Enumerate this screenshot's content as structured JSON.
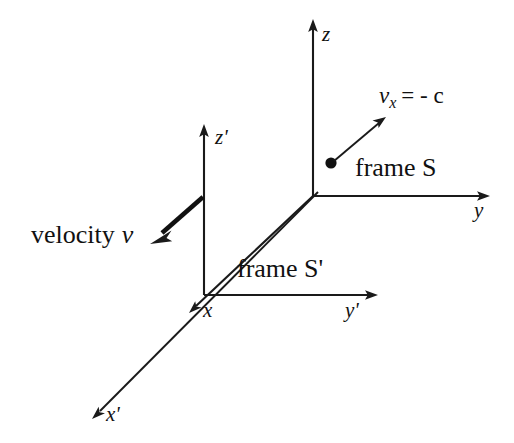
{
  "figure": {
    "type": "physics-reference-frame-diagram",
    "background_color": "#ffffff",
    "line_color": "#1a1a1a",
    "width": 514,
    "height": 443
  },
  "frame_s": {
    "name": "frame S",
    "origin": {
      "x": 313,
      "y": 196
    },
    "axes": [
      {
        "name": "z",
        "label": "z",
        "label_x": 322,
        "label_y": 26,
        "tip_x": 313,
        "tip_y": 22,
        "direction": "up"
      },
      {
        "name": "y",
        "label": "y",
        "label_x": 474,
        "label_y": 200,
        "tip_x": 490,
        "tip_y": 196,
        "direction": "right"
      },
      {
        "name": "x",
        "label": "x",
        "label_x": 201,
        "label_y": 308,
        "tip_x": 190,
        "tip_y": 311,
        "direction": "down-left"
      }
    ],
    "particle": {
      "name": "particle",
      "x": 331,
      "y": 163,
      "radius": 5.5,
      "velocity_label": "v",
      "velocity_subscript": "x",
      "velocity_equals": "= - c",
      "velocity_text": "vx = - c",
      "arrow_from": {
        "x": 336,
        "y": 159
      },
      "arrow_to": {
        "x": 385,
        "y": 118
      }
    }
  },
  "frame_s_prime": {
    "name": "frame S'",
    "origin": {
      "x": 204,
      "y": 295
    },
    "axes": [
      {
        "name": "z-prime",
        "label": "z'",
        "label_x": 215,
        "label_y": 131,
        "tip_x": 204,
        "tip_y": 127,
        "direction": "up"
      },
      {
        "name": "y-prime",
        "label": "y'",
        "label_x": 340,
        "label_y": 300,
        "tip_x": 378,
        "tip_y": 296,
        "direction": "right"
      },
      {
        "name": "x-prime",
        "label": "x'",
        "label_x": 105,
        "label_y": 407,
        "tip_x": 93,
        "tip_y": 417,
        "direction": "down-left"
      }
    ],
    "velocity": {
      "label_prefix": "velocity",
      "label_var": "v",
      "label_text": "velocity v",
      "label_x": 30,
      "label_y": 224,
      "arrow_from": {
        "x": 203,
        "y": 197
      },
      "arrow_to": {
        "x": 153,
        "y": 241
      }
    }
  },
  "labels": {
    "frame_s": "frame S",
    "frame_s_prime": "frame S'",
    "frame_s_x": 355,
    "frame_s_y": 158,
    "frame_s_prime_x": 235,
    "frame_s_prime_y": 257,
    "z": "z",
    "y": "y",
    "x": "x",
    "z_prime": "z'",
    "y_prime": "y'",
    "x_prime": "x'",
    "vx_var": "v",
    "vx_sub": "x",
    "vx_rest": "= - c",
    "vx_x": 378,
    "vx_y": 85,
    "velocity_prefix": "velocity",
    "velocity_var": "v"
  }
}
